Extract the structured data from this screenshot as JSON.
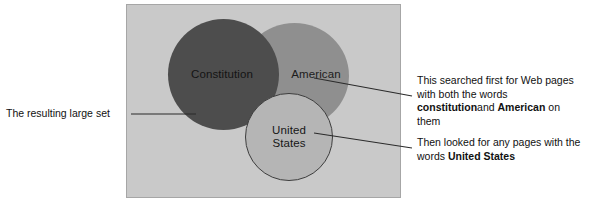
{
  "figure": {
    "type": "venn-diagram",
    "title": "",
    "panel": {
      "background_color": "#c9c9c9",
      "border_color": "#a6a6a6"
    },
    "sets": [
      {
        "id": "constitution",
        "label": "Constitution",
        "fill_color": "#4d4d4d",
        "role": "first-search-term"
      },
      {
        "id": "american",
        "label": "American",
        "fill_color": "#8c8c8c",
        "role": "second-search-term"
      },
      {
        "id": "united-states",
        "label": "United\nStates",
        "fill_color": "#b5b5b5",
        "border_color": "#3d3d3d",
        "role": "third-search-term"
      }
    ],
    "annotations": {
      "left": {
        "text": "The resulting large set",
        "points_to": "constitution"
      },
      "right_top": {
        "line1": "This searched first for Web pages",
        "line2_pre": "with both the words ",
        "line2_bold": "constitution",
        "line3_bold": "American",
        "line3_pre": "and ",
        "line3_post": " on them",
        "points_to": "american"
      },
      "right_bottom": {
        "line1": "Then looked for any pages with the",
        "line2_pre": "words ",
        "line2_bold": "United States",
        "points_to": "united-states"
      }
    }
  }
}
